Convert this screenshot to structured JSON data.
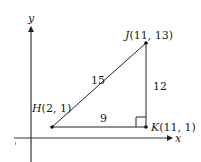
{
  "axes": {
    "x_label": "x",
    "y_label": "y"
  },
  "points": {
    "H": {
      "name": "H",
      "coords": "(2, 1)"
    },
    "J": {
      "name": "J",
      "coords": "(11, 13)"
    },
    "K": {
      "name": "K",
      "coords": "(11, 1)"
    }
  },
  "segments": {
    "HJ": "15",
    "JK": "12",
    "HK": "9"
  },
  "colors": {
    "line": "#222222",
    "background": "#ffffff"
  }
}
